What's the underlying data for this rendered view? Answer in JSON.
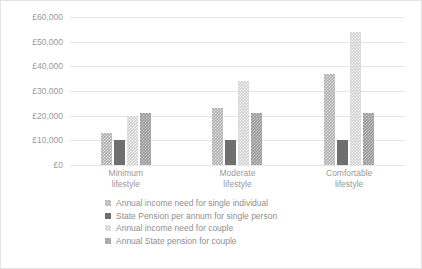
{
  "chart_data": {
    "type": "bar",
    "title": "",
    "xlabel": "",
    "ylabel": "",
    "ylim": [
      0,
      60000
    ],
    "ytick_step": 10000,
    "grid": true,
    "legend_position": "bottom",
    "categories": [
      "Minimum lifestyle",
      "Moderate lifestyle",
      "Comfortable lifestyle"
    ],
    "category_lines": [
      [
        "Minimum",
        "lifestyle"
      ],
      [
        "Moderate",
        "lifestyle"
      ],
      [
        "Comfortable",
        "lifestyle"
      ]
    ],
    "ytick_labels": [
      "£60,000",
      "£50,000",
      "£40,000",
      "£30,000",
      "£20,000",
      "£10,000",
      "£0"
    ],
    "ytick_values": [
      60000,
      50000,
      40000,
      30000,
      20000,
      10000,
      0
    ],
    "series": [
      {
        "name": "Annual income need for single individual",
        "color": "#b0b0b0",
        "values": [
          13000,
          23000,
          37000
        ]
      },
      {
        "name": "State Pension per annum for single person",
        "color": "#6f6f6f",
        "values": [
          10000,
          10000,
          10000
        ]
      },
      {
        "name": "Annual income need for couple",
        "color": "#d2d2d2",
        "values": [
          20000,
          34000,
          54000
        ]
      },
      {
        "name": "Annual State pension for couple",
        "color": "#9a9a9a",
        "values": [
          21000,
          21000,
          21000
        ]
      }
    ]
  }
}
